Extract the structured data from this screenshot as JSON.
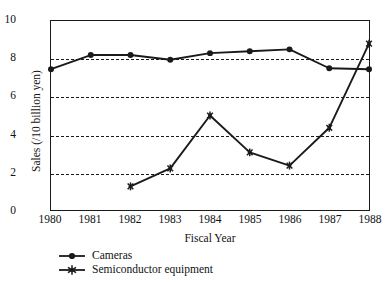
{
  "chart_data": {
    "type": "line",
    "title": "",
    "xlabel": "Fiscal Year",
    "ylabel": "Sales (/10 billion yen)",
    "categories": [
      "1980",
      "1981",
      "1982",
      "1983",
      "1984",
      "1985",
      "1986",
      "1987",
      "1988"
    ],
    "x": [
      1980,
      1981,
      1982,
      1983,
      1984,
      1985,
      1986,
      1987,
      1988
    ],
    "xlim": [
      1980,
      1988
    ],
    "ylim": [
      0,
      10
    ],
    "yticks": [
      0,
      2,
      4,
      6,
      8,
      10
    ],
    "ytick_labels": [
      "0",
      "2",
      "4",
      "6",
      "8",
      "10"
    ],
    "grid": "horizontal-dashed",
    "gridlines": [
      2,
      4,
      6,
      8
    ],
    "legend_position": "below-axes-left",
    "series": [
      {
        "name": "Cameras",
        "marker": "filled-circle",
        "color": "#1a1a1a",
        "x": [
          1980,
          1981,
          1982,
          1983,
          1984,
          1985,
          1986,
          1987,
          1988
        ],
        "values": [
          7.45,
          8.2,
          8.2,
          7.95,
          8.3,
          8.4,
          8.5,
          7.5,
          7.45
        ]
      },
      {
        "name": "Semiconductor equipment",
        "marker": "star",
        "color": "#1a1a1a",
        "x": [
          1982,
          1983,
          1984,
          1985,
          1986,
          1987,
          1988
        ],
        "values": [
          1.25,
          2.2,
          5.0,
          3.05,
          2.35,
          4.35,
          8.8
        ]
      }
    ]
  },
  "axes": {
    "ylabel": "Sales (/10 billion yen)",
    "xlabel": "Fiscal Year",
    "ytick_labels": [
      "10",
      "8",
      "6",
      "4",
      "2",
      "0"
    ],
    "xtick_labels": [
      "1980",
      "1981",
      "1982",
      "1983",
      "1984",
      "1985",
      "1986",
      "1987",
      "1988"
    ]
  },
  "legend": {
    "items": [
      {
        "label": "Cameras",
        "marker": "filled-circle"
      },
      {
        "label": "Semiconductor equipment",
        "marker": "star"
      }
    ]
  }
}
